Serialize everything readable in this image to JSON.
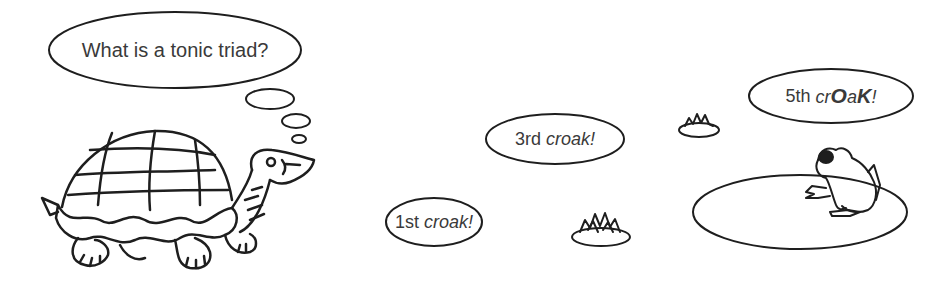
{
  "scene": {
    "background": "#ffffff",
    "ink": "#1e1e1e",
    "text_color": "#3a3a3a"
  },
  "turtle": {
    "thought": "What is a tonic triad?"
  },
  "croaks": {
    "first": {
      "ordinal": "1st",
      "word": "croak!"
    },
    "third": {
      "ordinal": "3rd",
      "word": "croak!"
    },
    "fifth": {
      "ordinal": "5th",
      "word_parts": [
        "cr",
        "O",
        "a",
        "K",
        "!"
      ]
    }
  },
  "icons": [
    "turtle-illustration",
    "frog-illustration",
    "lily-pad-icon",
    "grass-tuft-icon",
    "thought-bubble-icon",
    "speech-bubble-icon"
  ]
}
